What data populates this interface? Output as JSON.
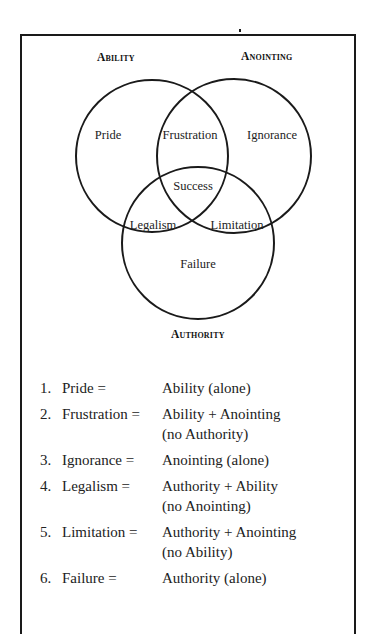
{
  "diagram": {
    "circles": [
      {
        "id": "ability",
        "label": "Ability",
        "cx": 152,
        "cy": 156,
        "r": 76
      },
      {
        "id": "anointing",
        "label": "Anointing",
        "cx": 234,
        "cy": 156,
        "r": 77
      },
      {
        "id": "authority",
        "label": "Authority",
        "cx": 198,
        "cy": 243,
        "r": 76
      }
    ],
    "labels": {
      "ability": "Ability",
      "anointing": "Anointing",
      "authority": "Authority"
    },
    "regions": {
      "pride": "Pride",
      "frustration": "Frustration",
      "ignorance": "Ignorance",
      "success": "Success",
      "legalism": "Legalism",
      "limitation": "Limitation",
      "failure": "Failure"
    },
    "stroke_color": "#1a1a1a"
  },
  "legend": [
    {
      "num": "1.",
      "term": "Pride =",
      "def1": "Ability (alone)",
      "def2": ""
    },
    {
      "num": "2.",
      "term": "Frustration =",
      "def1": "Ability + Anointing",
      "def2": "(no Authority)"
    },
    {
      "num": "3.",
      "term": "Ignorance =",
      "def1": "Anointing (alone)",
      "def2": ""
    },
    {
      "num": "4.",
      "term": "Legalism =",
      "def1": "Authority + Ability",
      "def2": "(no Anointing)"
    },
    {
      "num": "5.",
      "term": "Limitation =",
      "def1": "Authority + Anointing",
      "def2": "(no Ability)"
    },
    {
      "num": "6.",
      "term": "Failure =",
      "def1": "Authority (alone)",
      "def2": ""
    }
  ]
}
